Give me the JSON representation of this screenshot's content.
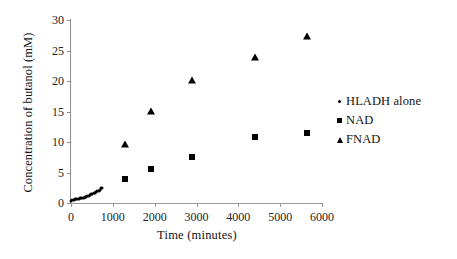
{
  "chart_data": {
    "type": "scatter",
    "title": "",
    "xlabel": "Time (minutes)",
    "ylabel": "Concentration of butanol (mM)",
    "xlim": [
      0,
      6000
    ],
    "ylim": [
      0,
      30
    ],
    "xticks": [
      0,
      1000,
      2000,
      3000,
      4000,
      5000,
      6000
    ],
    "yticks": [
      0,
      5,
      10,
      15,
      20,
      25,
      30
    ],
    "xtick_labels": [
      "0",
      "1000",
      "2000",
      "3000",
      "4000",
      "5000",
      "6000"
    ],
    "ytick_labels": [
      "0",
      "5",
      "10",
      "15",
      "20",
      "25",
      "30"
    ],
    "grid": false,
    "legend_position": "right",
    "marker_color": "#000000",
    "series": [
      {
        "name": "HLADH alone",
        "marker": "dot",
        "points": [
          [
            0,
            0.4
          ],
          [
            30,
            0.5
          ],
          [
            60,
            0.5
          ],
          [
            90,
            0.6
          ],
          [
            120,
            0.6
          ],
          [
            150,
            0.7
          ],
          [
            180,
            0.7
          ],
          [
            210,
            0.8
          ],
          [
            240,
            0.8
          ],
          [
            270,
            0.9
          ],
          [
            300,
            0.9
          ],
          [
            330,
            1.0
          ],
          [
            360,
            1.0
          ],
          [
            390,
            1.1
          ],
          [
            420,
            1.2
          ],
          [
            450,
            1.3
          ],
          [
            480,
            1.4
          ],
          [
            510,
            1.5
          ],
          [
            540,
            1.6
          ],
          [
            570,
            1.7
          ],
          [
            600,
            1.8
          ],
          [
            630,
            1.9
          ],
          [
            660,
            2.0
          ],
          [
            690,
            2.2
          ],
          [
            720,
            2.4
          ],
          [
            740,
            2.5
          ]
        ]
      },
      {
        "name": "NAD",
        "marker": "square",
        "points": [
          [
            1300,
            4.0
          ],
          [
            1920,
            5.5
          ],
          [
            2900,
            7.6
          ],
          [
            4400,
            10.9
          ],
          [
            5650,
            11.4
          ]
        ]
      },
      {
        "name": "FNAD",
        "marker": "triangle",
        "points": [
          [
            1300,
            9.7
          ],
          [
            1920,
            15.1
          ],
          [
            2900,
            20.1
          ],
          [
            4400,
            23.9
          ],
          [
            5650,
            27.3
          ]
        ]
      }
    ]
  }
}
